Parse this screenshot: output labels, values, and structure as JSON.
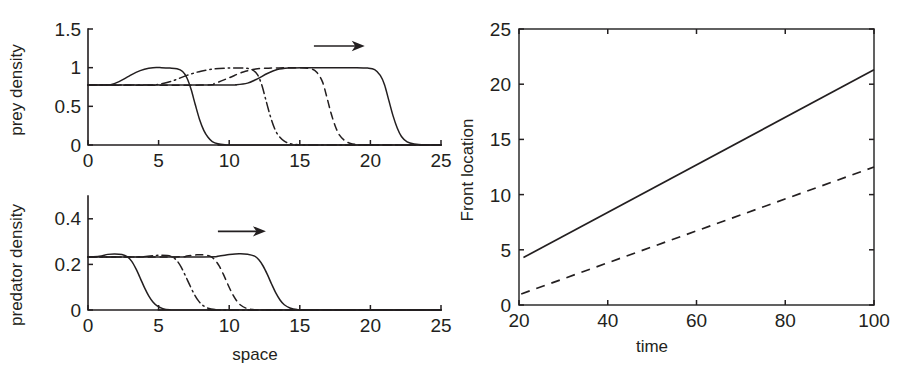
{
  "figure": {
    "background": "#ffffff",
    "ink": "#231f20"
  },
  "chart_data": [
    {
      "id": "prey",
      "type": "line",
      "title": "",
      "xlabel": "",
      "ylabel": "prey density",
      "xlim": [
        0,
        25
      ],
      "ylim": [
        0,
        1.5
      ],
      "xticks": [
        0,
        5,
        10,
        15,
        20,
        25
      ],
      "xticklabels": [
        "0",
        "5",
        "10",
        "15",
        "20",
        "25"
      ],
      "yticks": [
        0,
        0.5,
        1,
        1.5
      ],
      "yticklabels": [
        "0",
        "0.5",
        "1",
        "1.5"
      ],
      "grid": false,
      "legend": "none",
      "annotations": [
        {
          "kind": "arrow",
          "label": "rightward-travel-arrow",
          "x_start": 16.0,
          "x_end": 19.6,
          "y": 1.28
        }
      ],
      "series": [
        {
          "name": "prey profile t1",
          "style": "solid",
          "plateau": 0.77,
          "peak": 1.0,
          "front": 7.6,
          "points": [
            [
              0.0,
              0.775
            ],
            [
              1.0,
              0.775
            ],
            [
              1.6,
              0.78
            ],
            [
              2.2,
              0.82
            ],
            [
              2.8,
              0.88
            ],
            [
              3.4,
              0.94
            ],
            [
              4.0,
              0.98
            ],
            [
              4.6,
              1.0
            ],
            [
              5.2,
              1.0
            ],
            [
              5.8,
              0.995
            ],
            [
              6.3,
              0.985
            ],
            [
              6.7,
              0.95
            ],
            [
              7.0,
              0.87
            ],
            [
              7.3,
              0.72
            ],
            [
              7.6,
              0.52
            ],
            [
              7.9,
              0.33
            ],
            [
              8.2,
              0.19
            ],
            [
              8.5,
              0.1
            ],
            [
              8.8,
              0.045
            ],
            [
              9.2,
              0.015
            ],
            [
              9.7,
              0.004
            ],
            [
              10.5,
              0.0
            ],
            [
              25.0,
              0.0
            ]
          ]
        },
        {
          "name": "prey profile t2",
          "style": "dashdot",
          "plateau": 0.77,
          "peak": 1.0,
          "front": 12.2,
          "points": [
            [
              0.0,
              0.775
            ],
            [
              4.0,
              0.775
            ],
            [
              5.0,
              0.785
            ],
            [
              6.0,
              0.83
            ],
            [
              7.0,
              0.9
            ],
            [
              8.0,
              0.955
            ],
            [
              9.0,
              0.985
            ],
            [
              10.0,
              0.995
            ],
            [
              11.0,
              0.995
            ],
            [
              11.6,
              0.975
            ],
            [
              12.0,
              0.91
            ],
            [
              12.3,
              0.78
            ],
            [
              12.6,
              0.58
            ],
            [
              12.9,
              0.38
            ],
            [
              13.2,
              0.22
            ],
            [
              13.5,
              0.12
            ],
            [
              13.9,
              0.05
            ],
            [
              14.3,
              0.018
            ],
            [
              14.9,
              0.004
            ],
            [
              15.6,
              0.0
            ],
            [
              25.0,
              0.0
            ]
          ]
        },
        {
          "name": "prey profile t3",
          "style": "dashed",
          "plateau": 0.77,
          "peak": 1.0,
          "front": 16.6,
          "points": [
            [
              0.0,
              0.775
            ],
            [
              8.0,
              0.775
            ],
            [
              9.0,
              0.8
            ],
            [
              10.0,
              0.87
            ],
            [
              11.0,
              0.945
            ],
            [
              12.0,
              0.985
            ],
            [
              13.0,
              0.995
            ],
            [
              14.0,
              0.998
            ],
            [
              15.0,
              0.998
            ],
            [
              15.8,
              0.985
            ],
            [
              16.2,
              0.94
            ],
            [
              16.6,
              0.82
            ],
            [
              16.9,
              0.63
            ],
            [
              17.2,
              0.42
            ],
            [
              17.5,
              0.25
            ],
            [
              17.8,
              0.13
            ],
            [
              18.2,
              0.055
            ],
            [
              18.6,
              0.02
            ],
            [
              19.2,
              0.005
            ],
            [
              20.0,
              0.0
            ],
            [
              25.0,
              0.0
            ]
          ]
        },
        {
          "name": "prey profile t4",
          "style": "solid",
          "plateau": 0.77,
          "peak": 1.0,
          "front": 20.6,
          "points": [
            [
              0.0,
              0.775
            ],
            [
              9.5,
              0.775
            ],
            [
              10.5,
              0.78
            ],
            [
              11.3,
              0.8
            ],
            [
              12.0,
              0.855
            ],
            [
              12.7,
              0.925
            ],
            [
              13.4,
              0.975
            ],
            [
              14.2,
              0.995
            ],
            [
              15.2,
              1.0
            ],
            [
              17.0,
              1.0
            ],
            [
              19.0,
              1.0
            ],
            [
              19.8,
              0.995
            ],
            [
              20.3,
              0.975
            ],
            [
              20.7,
              0.9
            ],
            [
              21.0,
              0.78
            ],
            [
              21.3,
              0.58
            ],
            [
              21.6,
              0.38
            ],
            [
              21.9,
              0.22
            ],
            [
              22.2,
              0.11
            ],
            [
              22.6,
              0.04
            ],
            [
              23.1,
              0.012
            ],
            [
              23.8,
              0.0
            ],
            [
              25.0,
              0.0
            ]
          ]
        }
      ]
    },
    {
      "id": "predator",
      "type": "line",
      "title": "",
      "xlabel": "space",
      "ylabel": "predator density",
      "xlim": [
        0,
        25
      ],
      "ylim": [
        0,
        0.5
      ],
      "xticks": [
        0,
        5,
        10,
        15,
        20,
        25
      ],
      "xticklabels": [
        "0",
        "5",
        "10",
        "15",
        "20",
        "25"
      ],
      "yticks": [
        0,
        0.2,
        0.4
      ],
      "yticklabels": [
        "0",
        "0.2",
        "0.4"
      ],
      "grid": false,
      "legend": "none",
      "annotations": [
        {
          "kind": "arrow",
          "label": "rightward-travel-arrow",
          "x_start": 9.2,
          "x_end": 12.6,
          "y": 0.345
        }
      ],
      "series": [
        {
          "name": "predator profile t1",
          "style": "solid",
          "plateau": 0.233,
          "peak": 0.245,
          "front": 3.5,
          "points": [
            [
              0.0,
              0.233
            ],
            [
              0.8,
              0.236
            ],
            [
              1.4,
              0.244
            ],
            [
              1.9,
              0.246
            ],
            [
              2.4,
              0.243
            ],
            [
              2.8,
              0.233
            ],
            [
              3.1,
              0.213
            ],
            [
              3.4,
              0.18
            ],
            [
              3.7,
              0.14
            ],
            [
              4.0,
              0.098
            ],
            [
              4.3,
              0.062
            ],
            [
              4.6,
              0.035
            ],
            [
              4.9,
              0.018
            ],
            [
              5.3,
              0.006
            ],
            [
              5.8,
              0.001
            ],
            [
              6.5,
              0.0
            ],
            [
              25.0,
              0.0
            ]
          ]
        },
        {
          "name": "predator profile t2",
          "style": "dashdot",
          "plateau": 0.233,
          "peak": 0.24,
          "front": 6.6,
          "points": [
            [
              0.0,
              0.233
            ],
            [
              3.5,
              0.233
            ],
            [
              4.4,
              0.237
            ],
            [
              5.0,
              0.24
            ],
            [
              5.6,
              0.239
            ],
            [
              6.0,
              0.232
            ],
            [
              6.3,
              0.216
            ],
            [
              6.6,
              0.188
            ],
            [
              6.9,
              0.15
            ],
            [
              7.2,
              0.11
            ],
            [
              7.5,
              0.072
            ],
            [
              7.8,
              0.042
            ],
            [
              8.1,
              0.022
            ],
            [
              8.5,
              0.008
            ],
            [
              9.0,
              0.002
            ],
            [
              9.8,
              0.0
            ],
            [
              25.0,
              0.0
            ]
          ]
        },
        {
          "name": "predator profile t3",
          "style": "dashed",
          "plateau": 0.233,
          "peak": 0.242,
          "front": 9.2,
          "points": [
            [
              0.0,
              0.233
            ],
            [
              6.2,
              0.233
            ],
            [
              7.0,
              0.237
            ],
            [
              7.7,
              0.242
            ],
            [
              8.3,
              0.241
            ],
            [
              8.7,
              0.234
            ],
            [
              9.0,
              0.219
            ],
            [
              9.3,
              0.192
            ],
            [
              9.6,
              0.155
            ],
            [
              9.9,
              0.113
            ],
            [
              10.2,
              0.074
            ],
            [
              10.5,
              0.043
            ],
            [
              10.8,
              0.022
            ],
            [
              11.2,
              0.008
            ],
            [
              11.7,
              0.002
            ],
            [
              12.4,
              0.0
            ],
            [
              25.0,
              0.0
            ]
          ]
        },
        {
          "name": "predator profile t4",
          "style": "solid",
          "plateau": 0.233,
          "peak": 0.247,
          "front": 12.2,
          "points": [
            [
              0.0,
              0.233
            ],
            [
              8.2,
              0.233
            ],
            [
              9.2,
              0.236
            ],
            [
              10.0,
              0.243
            ],
            [
              10.7,
              0.247
            ],
            [
              11.3,
              0.245
            ],
            [
              11.8,
              0.236
            ],
            [
              12.1,
              0.22
            ],
            [
              12.4,
              0.193
            ],
            [
              12.7,
              0.156
            ],
            [
              13.0,
              0.114
            ],
            [
              13.3,
              0.075
            ],
            [
              13.6,
              0.044
            ],
            [
              13.9,
              0.023
            ],
            [
              14.3,
              0.009
            ],
            [
              14.8,
              0.002
            ],
            [
              15.6,
              0.0
            ],
            [
              25.0,
              0.0
            ]
          ]
        }
      ]
    },
    {
      "id": "front-location",
      "type": "line",
      "title": "",
      "xlabel": "time",
      "ylabel": "Front location",
      "xlim": [
        20,
        100
      ],
      "ylim": [
        0,
        25
      ],
      "xticks": [
        20,
        40,
        60,
        80,
        100
      ],
      "xticklabels": [
        "20",
        "40",
        "60",
        "80",
        "100"
      ],
      "yticks": [
        0,
        5,
        10,
        15,
        20,
        25
      ],
      "yticklabels": [
        "0",
        "5",
        "10",
        "15",
        "20",
        "25"
      ],
      "grid": false,
      "legend": "none",
      "frame": "box",
      "series": [
        {
          "name": "prey front",
          "style": "solid",
          "points": [
            [
              21.0,
              4.3
            ],
            [
              100.0,
              21.3
            ]
          ]
        },
        {
          "name": "predator front",
          "style": "dashed",
          "points": [
            [
              20.5,
              1.0
            ],
            [
              100.0,
              12.5
            ]
          ]
        }
      ]
    }
  ]
}
